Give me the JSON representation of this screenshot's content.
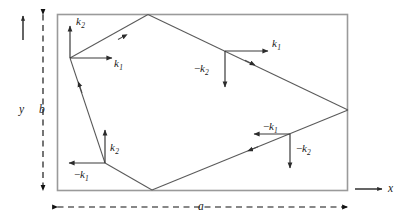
{
  "figure": {
    "name": "wave-vector-ray-path-rectangle",
    "colors": {
      "line": "#3d3d3d",
      "rect": "#9a9a9a",
      "text": "#1a1a1a",
      "background": "#ffffff"
    }
  },
  "axes": {
    "y_label": "y",
    "x_label": "x"
  },
  "dimensions": {
    "width_label": "a",
    "height_label": "b"
  },
  "vectors": [
    {
      "id": "top-left",
      "k1": {
        "label_minus": "",
        "symbol": "k",
        "subscript": "1",
        "direction": "right"
      },
      "k2": {
        "label_minus": "",
        "symbol": "k",
        "subscript": "2",
        "direction": "up"
      }
    },
    {
      "id": "top-right",
      "k1": {
        "label_minus": "",
        "symbol": "k",
        "subscript": "1",
        "direction": "right"
      },
      "k2": {
        "label_minus": "−",
        "symbol": "k",
        "subscript": "2",
        "direction": "down"
      }
    },
    {
      "id": "bottom-left",
      "k1": {
        "label_minus": "−",
        "symbol": "k",
        "subscript": "1",
        "direction": "left"
      },
      "k2": {
        "label_minus": "",
        "symbol": "k",
        "subscript": "2",
        "direction": "up"
      }
    },
    {
      "id": "bottom-right",
      "k1": {
        "label_minus": "−",
        "symbol": "k",
        "subscript": "1",
        "direction": "left"
      },
      "k2": {
        "label_minus": "−",
        "symbol": "k",
        "subscript": "2",
        "direction": "down"
      }
    }
  ],
  "labels": {
    "tl_k2_minus": "",
    "tl_k2_sym": "k",
    "tl_k2_sub": "2",
    "tl_k1_minus": "",
    "tl_k1_sym": "k",
    "tl_k1_sub": "1",
    "tr_k1_minus": "",
    "tr_k1_sym": "k",
    "tr_k1_sub": "1",
    "tr_k2_minus": "−",
    "tr_k2_sym": "k",
    "tr_k2_sub": "2",
    "bl_k2_minus": "",
    "bl_k2_sym": "k",
    "bl_k2_sub": "2",
    "bl_k1_minus": "−",
    "bl_k1_sym": "k",
    "bl_k1_sub": "1",
    "br_k1_minus": "−",
    "br_k1_sym": "k",
    "br_k1_sub": "1",
    "br_k2_minus": "−",
    "br_k2_sym": "k",
    "br_k2_sub": "2",
    "axis_y": "y",
    "axis_x": "x",
    "dim_a": "a",
    "dim_b": "b"
  }
}
